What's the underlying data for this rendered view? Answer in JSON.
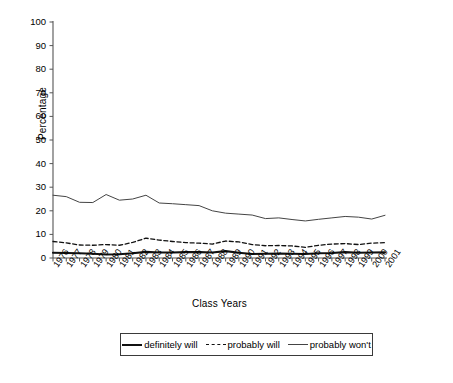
{
  "chart_data": {
    "type": "line",
    "title": "",
    "xlabel": "Class Years",
    "ylabel": "Percentage",
    "ylim": [
      0,
      100
    ],
    "yticks": [
      0,
      10,
      20,
      30,
      40,
      50,
      60,
      70,
      80,
      90,
      100
    ],
    "grid": false,
    "legend_position": "bottom",
    "categories": [
      "1976",
      "1977",
      "1978",
      "1979",
      "1980",
      "1981",
      "1982",
      "1983",
      "1984",
      "1985",
      "1986",
      "1987",
      "1988",
      "1989",
      "1990",
      "1991",
      "1992",
      "1993",
      "1994",
      "1995",
      "1996",
      "1997",
      "1998",
      "1999",
      "2000",
      "2001"
    ],
    "series": [
      {
        "name": "definitely will",
        "style": "thick-solid",
        "color": "#111111",
        "values": [
          2.2,
          2.1,
          2.0,
          1.8,
          1.5,
          1.6,
          2.0,
          2.6,
          2.3,
          2.3,
          2.5,
          2.5,
          2.3,
          2.9,
          2.2,
          1.7,
          1.8,
          1.9,
          1.8,
          1.7,
          2.0,
          2.1,
          2.5,
          2.2,
          2.3,
          2.4
        ]
      },
      {
        "name": "probably will",
        "style": "dashed",
        "color": "#111111",
        "values": [
          7.0,
          6.4,
          5.5,
          5.4,
          5.7,
          5.4,
          6.6,
          8.4,
          7.6,
          7.0,
          6.5,
          6.3,
          5.9,
          7.2,
          6.8,
          5.7,
          5.2,
          5.3,
          5.1,
          4.5,
          5.4,
          5.9,
          6.1,
          5.7,
          6.3,
          6.5
        ]
      },
      {
        "name": "probably won't",
        "style": "thin-solid",
        "color": "#444444",
        "values": [
          26.6,
          26.0,
          23.6,
          23.5,
          26.9,
          24.5,
          25.0,
          26.6,
          23.3,
          23.0,
          22.6,
          22.2,
          20.0,
          19.0,
          18.6,
          18.2,
          16.7,
          17.0,
          16.3,
          15.7,
          16.4,
          17.0,
          17.6,
          17.3,
          16.5,
          18.1
        ]
      }
    ]
  },
  "legend": {
    "items": [
      {
        "label": "definitely will"
      },
      {
        "label": "probably will"
      },
      {
        "label": "probably won't"
      }
    ]
  }
}
